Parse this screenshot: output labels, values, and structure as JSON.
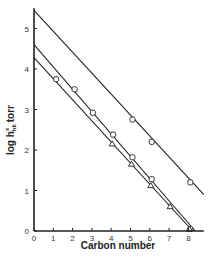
{
  "chart_data": {
    "type": "line",
    "title": "",
    "xlabel": "Carbon number",
    "ylabel": "log h",
    "ylabel_superscript": "x",
    "ylabel_subscript": "hc",
    "ylabel_units": ", torr",
    "xlim": [
      0,
      8.8
    ],
    "ylim": [
      0,
      5.5
    ],
    "x_ticks": [
      0,
      1,
      2,
      3,
      4,
      5,
      6,
      7,
      8
    ],
    "y_ticks": [
      0,
      1,
      2,
      3,
      4,
      5
    ],
    "grid": false,
    "legend": null,
    "series": [
      {
        "name": "upper line",
        "marker": "square",
        "line": [
          [
            0,
            5.45
          ],
          [
            8.8,
            0.9
          ]
        ],
        "points": [
          [
            5.1,
            2.75
          ],
          [
            6.1,
            2.2
          ],
          [
            8.1,
            1.2
          ]
        ]
      },
      {
        "name": "middle line",
        "marker": "square",
        "line": [
          [
            0,
            4.6
          ],
          [
            8.35,
            0
          ]
        ],
        "points": [
          [
            2.1,
            3.5
          ],
          [
            3.05,
            2.92
          ],
          [
            4.1,
            2.38
          ],
          [
            5.1,
            1.82
          ],
          [
            6.1,
            1.28
          ],
          [
            8.1,
            0.05
          ]
        ]
      },
      {
        "name": "lower line",
        "marker": "triangle",
        "line": [
          [
            0,
            4.28
          ],
          [
            8.22,
            0
          ]
        ],
        "points": [
          [
            1.15,
            3.75
          ],
          [
            4.05,
            2.15
          ],
          [
            5.05,
            1.65
          ],
          [
            6.05,
            1.12
          ],
          [
            7.05,
            0.6
          ],
          [
            8.05,
            0.05
          ]
        ]
      }
    ]
  },
  "axes": {
    "x_title": "Carbon number",
    "y_title_main": "log h",
    "y_title_sup": "x",
    "y_title_sub": "hc",
    "y_title_units": ", torr",
    "x_tick_labels": [
      "0",
      "1",
      "2",
      "3",
      "4",
      "5",
      "6",
      "7",
      "8"
    ],
    "y_tick_labels": [
      "0",
      "1",
      "2",
      "3",
      "4",
      "5"
    ]
  },
  "colors": {
    "line": "#222222",
    "marker_fill": "#ffffff",
    "text": "#333333"
  }
}
